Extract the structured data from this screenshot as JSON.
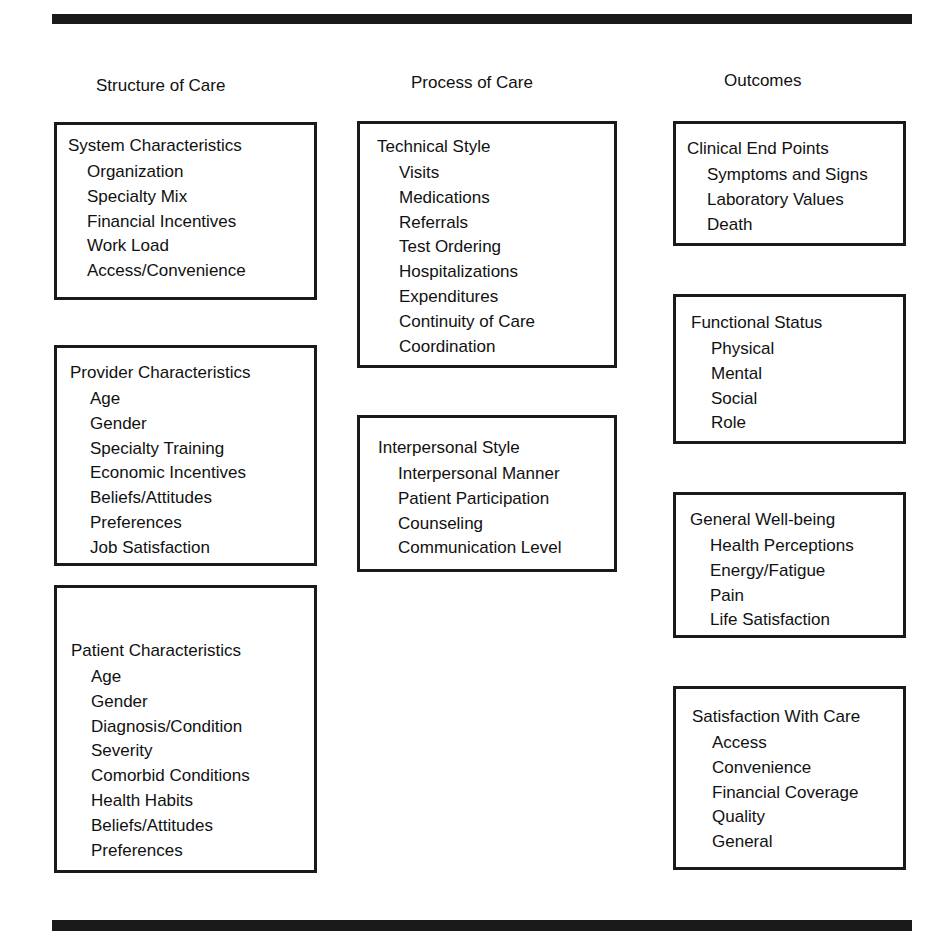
{
  "columns": [
    {
      "heading": "Structure of Care",
      "boxes": [
        {
          "title": "System Characteristics",
          "items": [
            "Organization",
            "Specialty Mix",
            "Financial Incentives",
            "Work Load",
            "Access/Convenience"
          ]
        },
        {
          "title": "Provider Characteristics",
          "items": [
            "Age",
            "Gender",
            "Specialty Training",
            "Economic Incentives",
            "Beliefs/Attitudes",
            "Preferences",
            "Job Satisfaction"
          ]
        },
        {
          "title": "Patient Characteristics",
          "items": [
            "Age",
            "Gender",
            "Diagnosis/Condition",
            "Severity",
            "Comorbid Conditions",
            "Health Habits",
            "Beliefs/Attitudes",
            "Preferences"
          ]
        }
      ]
    },
    {
      "heading": "Process of Care",
      "boxes": [
        {
          "title": "Technical Style",
          "items": [
            "Visits",
            "Medications",
            "Referrals",
            "Test Ordering",
            "Hospitalizations",
            "Expenditures",
            "Continuity of Care",
            "Coordination"
          ]
        },
        {
          "title": "Interpersonal Style",
          "items": [
            "Interpersonal Manner",
            "Patient Participation",
            "Counseling",
            "Communication Level"
          ]
        }
      ]
    },
    {
      "heading": "Outcomes",
      "boxes": [
        {
          "title": "Clinical End Points",
          "items": [
            "Symptoms and Signs",
            "Laboratory Values",
            "Death"
          ]
        },
        {
          "title": "Functional Status",
          "items": [
            "Physical",
            "Mental",
            "Social",
            "Role"
          ]
        },
        {
          "title": "General Well-being",
          "items": [
            "Health Perceptions",
            "Energy/Fatigue",
            "Pain",
            "Life Satisfaction"
          ]
        },
        {
          "title": "Satisfaction With Care",
          "items": [
            "Access",
            "Convenience",
            "Financial Coverage",
            "Quality",
            "General"
          ]
        }
      ]
    }
  ]
}
